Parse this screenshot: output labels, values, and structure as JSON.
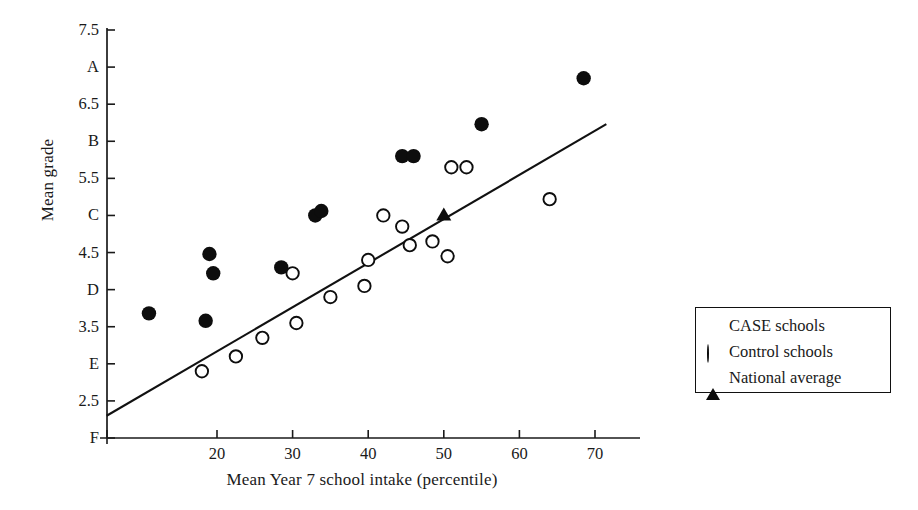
{
  "chart_data": {
    "type": "scatter",
    "title": "",
    "xlabel": "Mean Year 7 school intake (percentile)",
    "ylabel": "Mean grade",
    "xlim": [
      5.4,
      73.0
    ],
    "ylim": [
      2.0,
      7.5
    ],
    "grid": false,
    "legend_position": "right-outside",
    "x_ticks": [
      20,
      30,
      40,
      50,
      60,
      70
    ],
    "x_tick_labels": [
      "20",
      "30",
      "40",
      "50",
      "60",
      "70"
    ],
    "y_ticks": [
      7.5,
      7.0,
      6.5,
      6.0,
      5.5,
      5.0,
      4.5,
      4.0,
      3.5,
      3.0,
      2.5,
      2.0
    ],
    "y_tick_labels": [
      "7.5",
      "A",
      "6.5",
      "B",
      "5.5",
      "C",
      "4.5",
      "D",
      "3.5",
      "E",
      "2.5",
      "F"
    ],
    "series": [
      {
        "name": "CASE schools",
        "marker": "filled-circle",
        "color": "#0d0d0d",
        "points": [
          [
            11.0,
            3.68
          ],
          [
            18.5,
            3.58
          ],
          [
            19.0,
            4.48
          ],
          [
            19.5,
            4.22
          ],
          [
            28.5,
            4.3
          ],
          [
            33.0,
            5.0
          ],
          [
            33.8,
            5.06
          ],
          [
            44.5,
            5.8
          ],
          [
            46.0,
            5.8
          ],
          [
            55.0,
            6.23
          ],
          [
            68.5,
            6.85
          ]
        ]
      },
      {
        "name": "Control schools",
        "marker": "open-circle",
        "color": "#0d0d0d",
        "points": [
          [
            18.0,
            2.9
          ],
          [
            22.5,
            3.1
          ],
          [
            26.0,
            3.35
          ],
          [
            30.0,
            4.22
          ],
          [
            30.5,
            3.55
          ],
          [
            35.0,
            3.9
          ],
          [
            39.5,
            4.05
          ],
          [
            40.0,
            4.4
          ],
          [
            42.0,
            5.0
          ],
          [
            44.5,
            4.85
          ],
          [
            45.5,
            4.6
          ],
          [
            48.5,
            4.65
          ],
          [
            50.5,
            4.45
          ],
          [
            51.0,
            5.65
          ],
          [
            53.0,
            5.65
          ],
          [
            64.0,
            5.22
          ]
        ]
      },
      {
        "name": "National average",
        "marker": "triangle",
        "color": "#0d0d0d",
        "points": [
          [
            50.0,
            5.02
          ]
        ]
      }
    ],
    "trend_line": {
      "name": "regression-line",
      "x_start": 5.4,
      "y_start": 2.3,
      "x_end": 71.5,
      "y_end": 6.23
    }
  },
  "legend": {
    "items": [
      {
        "label": "CASE schools",
        "marker": "filled-circle"
      },
      {
        "label": "Control schools",
        "marker": "open-circle"
      },
      {
        "label": "National average",
        "marker": "triangle"
      }
    ]
  }
}
